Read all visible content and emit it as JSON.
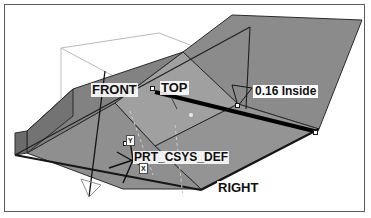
{
  "app": {
    "kind": "cad-3d-viewport",
    "title": "Sheet metal part 3D view"
  },
  "viewport": {
    "background_color": "#ffffff",
    "border_color": "#5a5a5a"
  },
  "model": {
    "description": "Isometric view of a sheet metal channel part with two bent flanges",
    "faces": [
      {
        "name": "upper-right-flange",
        "fill": "#8c8c8c"
      },
      {
        "name": "central-web",
        "fill": "#9e9e9e"
      },
      {
        "name": "lower-web",
        "fill": "#939393"
      },
      {
        "name": "left-flange",
        "fill": "#7f7f7f"
      },
      {
        "name": "left-flange-end",
        "fill": "#6f6f6f"
      }
    ],
    "highlight_edge_color": "#000000",
    "edge_color": "#2a2a2a"
  },
  "labels": {
    "front_plane": "FRONT",
    "top_plane": "TOP",
    "right_plane": "RIGHT",
    "csys": "PRT_CSYS_DEF",
    "dimension": "0.16 Inside"
  },
  "csys_axes": {
    "x": "X",
    "y": "Y",
    "z": "Z"
  },
  "handles": [
    {
      "name": "handle-top-plane",
      "x": 148,
      "y": 84
    },
    {
      "name": "handle-bend-vertex",
      "x": 233,
      "y": 101
    },
    {
      "name": "handle-edge-end",
      "x": 311,
      "y": 128
    },
    {
      "name": "handle-csys",
      "x": 121,
      "y": 139
    }
  ],
  "datum_planes": [
    {
      "name": "top-datum-plane",
      "stroke": "#b8b8b8"
    },
    {
      "name": "front-datum-plane",
      "stroke": "#1a1a1a"
    },
    {
      "name": "right-datum-plane",
      "stroke": "#2a2a2a"
    }
  ],
  "dimension_witness": {
    "name": "dimension-leader",
    "stroke": "#1a1a1a"
  }
}
